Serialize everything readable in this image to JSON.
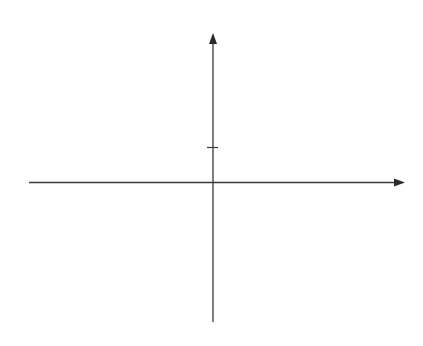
{
  "chart_data": {
    "type": "line",
    "title": "",
    "function": "y = tan x",
    "xlabel": "x",
    "ylabel": "y",
    "x_ticks": [
      {
        "value": -4.712,
        "label": "-3π/2",
        "sign": "−",
        "num": "3π",
        "den": "2"
      },
      {
        "value": -3.1416,
        "label": "-π",
        "sign": "−",
        "num": "π",
        "den": ""
      },
      {
        "value": -1.5708,
        "label": "-π/2",
        "sign": "−",
        "num": "π",
        "den": "2"
      },
      {
        "value": 0,
        "label": "0",
        "sign": "",
        "num": "0",
        "den": ""
      },
      {
        "value": 1.5708,
        "label": "π/2",
        "sign": "",
        "num": "π",
        "den": "2"
      },
      {
        "value": 3.1416,
        "label": "π",
        "sign": "",
        "num": "π",
        "den": ""
      },
      {
        "value": 4.712,
        "label": "3π/2",
        "sign": "",
        "num": "3π",
        "den": "2"
      }
    ],
    "y_ticks": [
      {
        "value": 1,
        "label": "1"
      }
    ],
    "asymptotes_x": [
      -4.712,
      -1.5708,
      1.5708,
      4.712
    ],
    "zeros_x": [
      -3.1416,
      0,
      3.1416
    ],
    "series": [
      {
        "name": "tan x branch 1",
        "x_range": [
          -4.712,
          -1.5708
        ],
        "through": [
          [
            -3.1416,
            0
          ]
        ]
      },
      {
        "name": "tan x branch 2",
        "x_range": [
          -1.5708,
          1.5708
        ],
        "through": [
          [
            0,
            0
          ],
          [
            0.7854,
            1
          ]
        ]
      },
      {
        "name": "tan x branch 3",
        "x_range": [
          1.5708,
          4.712
        ],
        "through": [
          [
            3.1416,
            0
          ]
        ]
      }
    ],
    "ylim": [
      -4,
      4
    ],
    "xlim": [
      -5.9,
      6.1
    ],
    "grid": false,
    "legend": null
  },
  "labels": {
    "x_axis": "x",
    "y_axis": "y",
    "one": "1",
    "zero": "0",
    "minus": "−",
    "pi": "π",
    "three_pi": "3π",
    "two": "2"
  }
}
